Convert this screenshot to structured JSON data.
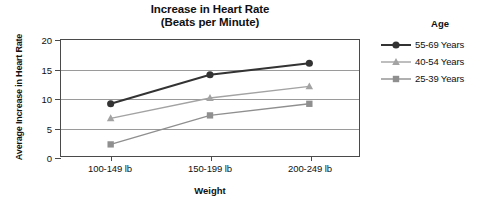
{
  "chart_data": {
    "type": "line",
    "title": "Increase in Heart Rate (Beats per Minute)",
    "title_lines": [
      "Increase in Heart Rate",
      "(Beats per Minute)"
    ],
    "xlabel": "Weight",
    "ylabel": "Average Increase in Heart Rate",
    "categories": [
      "100-149 lb",
      "150-199 lb",
      "200-249 lb"
    ],
    "ylim": [
      0,
      20
    ],
    "yticks": [
      0,
      5,
      10,
      15,
      20
    ],
    "ytick_labels": [
      "0",
      "5",
      "10",
      "15",
      "20"
    ],
    "grid": true,
    "legend_position": "right",
    "legend_title": "Age",
    "series": [
      {
        "name": "55-69 Years",
        "values": [
          9,
          14,
          16
        ],
        "color": "#333333",
        "marker": "circle"
      },
      {
        "name": "40-54 Years",
        "values": [
          6.5,
          10,
          12
        ],
        "color": "#a3a3a3",
        "marker": "triangle"
      },
      {
        "name": "25-39 Years",
        "values": [
          2,
          7,
          9
        ],
        "color": "#8f8f8f",
        "marker": "square"
      }
    ]
  }
}
